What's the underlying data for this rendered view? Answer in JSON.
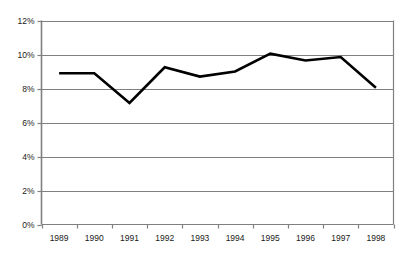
{
  "chart_data": {
    "type": "line",
    "title": "",
    "subtitle": "",
    "xlabel": "",
    "ylabel": "",
    "categories": [
      "1989",
      "1990",
      "1991",
      "1992",
      "1993",
      "1994",
      "1995",
      "1996",
      "1997",
      "1998"
    ],
    "values": [
      8.9,
      8.9,
      7.15,
      9.25,
      8.7,
      9.0,
      10.05,
      9.65,
      9.85,
      8.05
    ],
    "series": [
      {
        "name": "",
        "values": [
          8.9,
          8.9,
          7.15,
          9.25,
          8.7,
          9.0,
          10.05,
          9.65,
          9.85,
          8.05
        ]
      }
    ],
    "y_tick_labels": [
      "0%",
      "2%",
      "4%",
      "6%",
      "8%",
      "10%",
      "12%"
    ],
    "y_tick_values": [
      0,
      2,
      4,
      6,
      8,
      10,
      12
    ],
    "ylim": [
      0,
      12
    ],
    "value_suffix": "%",
    "grid": "horizontal",
    "legend": "none",
    "line_color": "#000000",
    "line_width": 2.6,
    "grid_color": "#808080",
    "axis_color": "#808080",
    "background_color": "#ffffff",
    "markers": "none",
    "annotations": []
  }
}
